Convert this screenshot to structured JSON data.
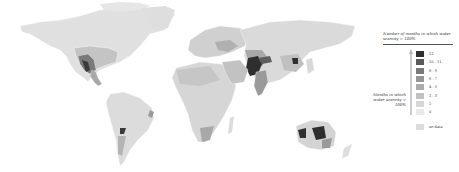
{
  "map": {
    "title": "World map of months per year with water scarcity > 100%",
    "colors": {
      "c12": "#2f2f2f",
      "c10_11": "#5a5a5a",
      "c8_9": "#7a7a7a",
      "c6_7": "#969696",
      "c4_5": "#ababab",
      "c2_3": "#c2c2c2",
      "c1": "#d6d6d6",
      "c0": "#e6e6e6",
      "nodata": "#dcdcdc"
    }
  },
  "legend": {
    "title": "Number of months in which water scarcity > 100%",
    "side_label": "Months in which water scarcity > 100%",
    "items": [
      {
        "label": "12",
        "color": "#2f2f2f"
      },
      {
        "label": "10 - 11",
        "color": "#5a5a5a"
      },
      {
        "label": "8 - 9",
        "color": "#7a7a7a"
      },
      {
        "label": "6 - 7",
        "color": "#969696"
      },
      {
        "label": "4 - 5",
        "color": "#ababab"
      },
      {
        "label": "2 - 3",
        "color": "#c2c2c2"
      },
      {
        "label": "1",
        "color": "#d6d6d6"
      },
      {
        "label": "0",
        "color": "#e9e9e9"
      }
    ],
    "nodata": {
      "label": "no data",
      "color": "#dcdcdc"
    }
  }
}
